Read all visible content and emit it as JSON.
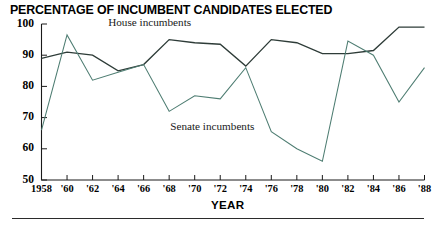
{
  "chart_data": {
    "type": "line",
    "title": "PERCENTAGE OF INCUMBENT CANDIDATES ELECTED",
    "xlabel": "YEAR",
    "ylabel": "",
    "categories": [
      "1958",
      "'60",
      "'62",
      "'64",
      "'66",
      "'68",
      "'70",
      "'72",
      "'74",
      "'76",
      "'78",
      "'80",
      "'82",
      "'84",
      "'86",
      "'88"
    ],
    "x_values": [
      1958,
      1960,
      1962,
      1964,
      1966,
      1968,
      1970,
      1972,
      1974,
      1976,
      1978,
      1980,
      1982,
      1984,
      1986,
      1988
    ],
    "ylim": [
      50,
      100
    ],
    "yticks": [
      50,
      60,
      70,
      80,
      90,
      100
    ],
    "ytick_labels": [
      "50",
      "60",
      "70",
      "80",
      "90",
      "100"
    ],
    "xlim": [
      1958,
      1988
    ],
    "grid": false,
    "legend_position": "inline-annotations",
    "series": [
      {
        "name": "House incumbents",
        "color": "#2e3c38",
        "values": [
          89,
          91,
          90,
          85,
          87,
          95,
          94,
          93.5,
          86.5,
          95,
          94,
          90.5,
          90.5,
          91.5,
          99,
          99
        ]
      },
      {
        "name": "Senate incumbents",
        "color": "#4e7d72",
        "values": [
          66,
          96.5,
          82,
          84.5,
          87,
          72,
          77,
          76,
          86,
          65.5,
          60,
          56,
          94.5,
          90,
          75,
          86
        ]
      }
    ],
    "annotations": [
      {
        "text": "House incumbents",
        "x": 1968,
        "y": 100.5
      },
      {
        "text": "Senate incumbents",
        "x": 1972,
        "y": 67
      }
    ]
  },
  "axis": {
    "y_tick_labels": [
      "100",
      "90",
      "80",
      "70",
      "60",
      "50"
    ],
    "x_tick_labels": [
      "1958",
      "'60",
      "'62",
      "'64",
      "'66",
      "'68",
      "'70",
      "'72",
      "'74",
      "'76",
      "'78",
      "'80",
      "'82",
      "'84",
      "'86",
      "'88"
    ],
    "x_title": "YEAR"
  },
  "annotations": {
    "house": "House incumbents",
    "senate": "Senate incumbents"
  },
  "title": "PERCENTAGE OF INCUMBENT CANDIDATES ELECTED"
}
